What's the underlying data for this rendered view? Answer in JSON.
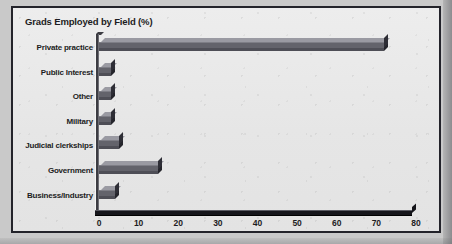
{
  "chart_data": {
    "type": "bar",
    "orientation": "horizontal",
    "title": "Grads Employed by Field (%)",
    "xlabel": "",
    "ylabel": "",
    "xlim": [
      0,
      80
    ],
    "xticks": [
      0,
      10,
      20,
      30,
      40,
      50,
      60,
      70,
      80
    ],
    "grid": false,
    "legend": false,
    "style": "3d-bar",
    "categories": [
      "Private practice",
      "Public Interest",
      "Other",
      "Military",
      "Judicial clerkships",
      "Government",
      "Business/Industry"
    ],
    "values": [
      72,
      3,
      3,
      3,
      5,
      15,
      4
    ],
    "colors": {
      "bar_front": "#63636b",
      "bar_top": "#9a9aa2",
      "bar_side": "#2e2e36",
      "axis": "#15151a",
      "frame": "#23232a",
      "plot_background": "#e9e9e9",
      "page_background": "#c9c9c9",
      "text": "#1c1c22"
    }
  }
}
